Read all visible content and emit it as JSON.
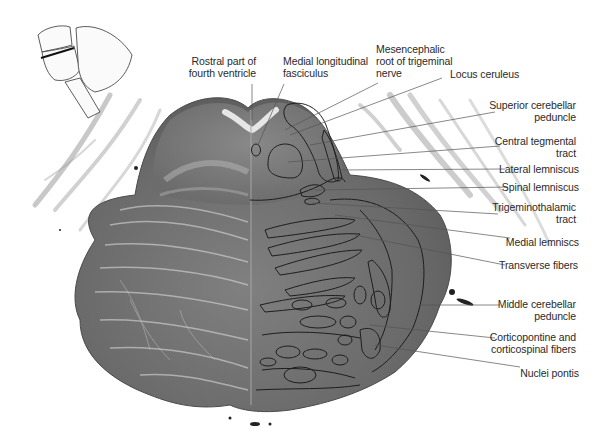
{
  "figure": {
    "colors": {
      "background": "#ffffff",
      "tissue_dark": "#5a5a5a",
      "tissue_mid": "#7a7a7a",
      "tissue_light": "#b8b8b8",
      "outline": "#1e1e1e",
      "leader_line": "#555555",
      "label_text": "#2a2a2a"
    }
  },
  "orientation_inset": {
    "name": "brainstem-cerebellum-sketch",
    "marker": "section-plane-line"
  },
  "labels": {
    "top": [
      {
        "id": "rostral-fourth-ventricle",
        "text": "Rostral part of\nfourth ventricle"
      },
      {
        "id": "medial-longitudinal-fasciculus",
        "text": "Medial longitudinal\nfasciculus"
      },
      {
        "id": "mesencephalic-root-trigeminal",
        "text": "Mesencephalic\nroot of trigeminal\nnerve"
      }
    ],
    "right": [
      {
        "id": "locus-ceruleus",
        "text": "Locus ceruleus"
      },
      {
        "id": "superior-cerebellar-peduncle",
        "text": "Superior cerebellar\npeduncle"
      },
      {
        "id": "central-tegmental-tract",
        "text": "Central tegmental\ntract"
      },
      {
        "id": "lateral-lemniscus",
        "text": "Lateral lemniscus"
      },
      {
        "id": "spinal-lemniscus",
        "text": "Spinal lemniscus"
      },
      {
        "id": "trigeminothalamic-tract",
        "text": "Trigeminothalamic\ntract"
      },
      {
        "id": "medial-lemniscus",
        "text": "Medial lemniscs"
      },
      {
        "id": "transverse-fibers",
        "text": "Transverse fibers"
      },
      {
        "id": "middle-cerebellar-peduncle",
        "text": "Middle cerebellar\npeduncle"
      },
      {
        "id": "corticopontine-corticospinal",
        "text": "Corticopontine and\ncorticospinal fibers"
      },
      {
        "id": "nuclei-pontis",
        "text": "Nuclei pontis"
      }
    ]
  }
}
